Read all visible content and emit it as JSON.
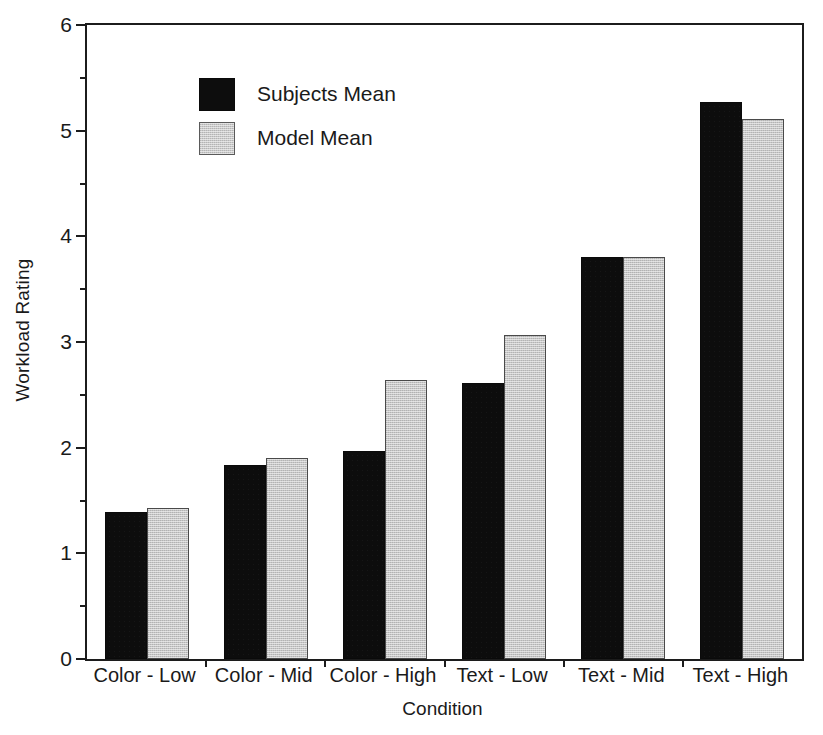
{
  "chart_data": {
    "type": "bar",
    "title": "",
    "xlabel": "Condition",
    "ylabel": "Workload Rating",
    "ylim": [
      0,
      6
    ],
    "ytick_labels": [
      "0",
      "1",
      "2",
      "3",
      "4",
      "5",
      "6"
    ],
    "ytick_values": [
      0,
      1,
      2,
      3,
      4,
      5,
      6
    ],
    "yminor_values": [
      0.5,
      1.5,
      2.5,
      3.5,
      4.5,
      5.5
    ],
    "grid": false,
    "legend_position": "upper-left-inside",
    "categories": [
      "Color - Low",
      "Color - Mid",
      "Color - High",
      "Text - Low",
      "Text - Mid",
      "Text - High"
    ],
    "series": [
      {
        "name": "Subjects Mean",
        "color": "#0d0d0d",
        "values": [
          1.39,
          1.84,
          1.97,
          2.61,
          3.8,
          5.27
        ]
      },
      {
        "name": "Model Mean",
        "color": "#c6c6c6",
        "values": [
          1.43,
          1.9,
          2.64,
          3.07,
          3.8,
          5.11
        ]
      }
    ]
  },
  "legend": {
    "items": [
      {
        "label": "Subjects Mean",
        "swatch": "black-filled-square"
      },
      {
        "label": "Model Mean",
        "swatch": "gray-filled-square"
      }
    ]
  },
  "axes": {
    "y_title": "Workload Rating",
    "x_title": "Condition"
  }
}
